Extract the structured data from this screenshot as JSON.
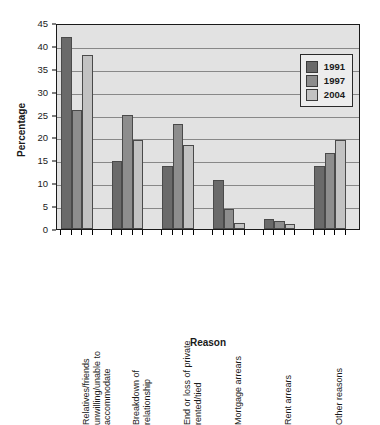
{
  "chart_data": {
    "type": "bar",
    "title": "",
    "subtitle": "",
    "xlabel": "Reason",
    "ylabel": "Percentage",
    "ylim": [
      0,
      45
    ],
    "ytick_step": 5,
    "yticks": [
      0,
      5,
      10,
      15,
      20,
      25,
      30,
      35,
      40,
      45
    ],
    "grid": true,
    "grid_axis": "y",
    "legend_position": "top-right",
    "categories": [
      "Relatives/friends unwilling/unable to accommodate",
      "Breakdown of relationship",
      "End or loss of private rented/tied",
      "Mortgage arrears",
      "Rent arrears",
      "Other reasons"
    ],
    "series": [
      {
        "name": "1991",
        "color": "#6a6a6a",
        "values": [
          42.0,
          14.9,
          13.8,
          10.7,
          2.2,
          13.7
        ]
      },
      {
        "name": "1997",
        "color": "#8d8d8d",
        "values": [
          25.9,
          24.9,
          22.9,
          4.3,
          1.8,
          16.6
        ]
      },
      {
        "name": "2004",
        "color": "#c2c2c2",
        "values": [
          38.0,
          19.4,
          18.3,
          1.4,
          1.2,
          19.5
        ]
      }
    ]
  },
  "legend": {
    "entries": [
      {
        "label": "1991",
        "color": "#6a6a6a"
      },
      {
        "label": "1997",
        "color": "#8d8d8d"
      },
      {
        "label": "2004",
        "color": "#c2c2c2"
      }
    ]
  },
  "axes": {
    "y_title": "Percentage",
    "x_title": "Reason"
  }
}
